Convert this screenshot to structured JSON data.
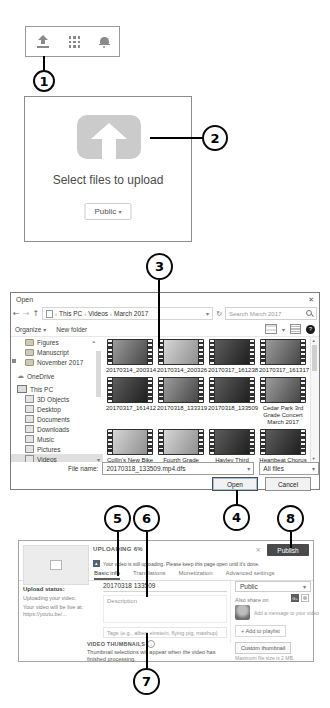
{
  "callouts": {
    "c1": "1",
    "c2": "2",
    "c3": "3",
    "c4": "4",
    "c5": "5",
    "c6": "6",
    "c7": "7",
    "c8": "8"
  },
  "header_bar": {
    "icons": {
      "upload": "upload-icon",
      "apps": "apps-grid-icon",
      "notifications": "bell-icon"
    }
  },
  "upload_panel": {
    "title": "Select files to upload",
    "privacy_button": "Public"
  },
  "open_dialog": {
    "title": "Open",
    "breadcrumb": {
      "s1": "This PC",
      "s2": "Videos",
      "s3": "March 2017"
    },
    "search_placeholder": "Search March 2017",
    "organize_button": "Organize",
    "new_folder_button": "New folder",
    "sidebar": [
      "Figures",
      "Manuscript",
      "November 2017",
      "OneDrive",
      "This PC",
      "3D Objects",
      "Desktop",
      "Documents",
      "Downloads",
      "Music",
      "Pictures",
      "Videos"
    ],
    "files": [
      "20170314_200314",
      "20170314_200326",
      "20170317_161238",
      "20170317_161317",
      "20170317_161412",
      "20170318_133319",
      "20170318_133509",
      "Cedar Park 3rd Grade Concert March 2017",
      "Collin's New Bike March 2017",
      "Fourth Grade Recorder Recital March 2017",
      "Hayley Third Grade Concert Solo March 2017",
      "Heartbeat Chorus Concert March 2017"
    ],
    "file_name_label": "File name:",
    "file_name_value": "20170318_133509.mp4.dfs",
    "file_type_value": "All files",
    "open_button": "Open",
    "cancel_button": "Cancel"
  },
  "youtube": {
    "uploading_label": "UPLOADING 6%",
    "publish_button": "Publish",
    "notice": "Your video is still uploading. Please keep this page open until it's done.",
    "tabs": [
      "Basic info",
      "Translations",
      "Monetization",
      "Advanced settings"
    ],
    "upload_status_heading": "Upload status:",
    "upload_status_line1": "Uploading your video.",
    "upload_status_line2": "Your video will be live at:",
    "upload_status_link": "https://youtu.be/...",
    "title_value": "20170318 133509",
    "description_placeholder": "Description",
    "tags_placeholder": "Tags (e.g., albert einstein, flying pig, mashup)",
    "privacy_value": "Public",
    "also_share_label": "Also share on",
    "message_placeholder": "Add a message to your video",
    "add_playlist_button": "+ Add to playlist",
    "thumbnails_heading": "VIDEO THUMBNAILS",
    "thumbnails_note": "Thumbnail selections will appear when the video has finished processing.",
    "custom_thumb_button": "Custom thumbnail",
    "custom_thumb_note": "Maximum file size is 2 MB."
  }
}
